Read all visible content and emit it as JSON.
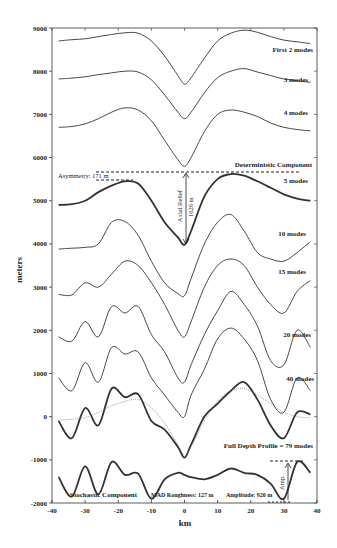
{
  "chart_data": {
    "type": "line",
    "title": "",
    "xlabel": "km",
    "ylabel": "meters",
    "xlim": [
      -40,
      40
    ],
    "ylim": [
      -2000,
      9000
    ],
    "xticks": [
      -40,
      -30,
      -20,
      -10,
      0,
      10,
      20,
      30,
      40
    ],
    "yticks": [
      -2000,
      -1000,
      0,
      1000,
      2000,
      3000,
      4000,
      5000,
      6000,
      7000,
      8000,
      9000
    ],
    "grid": false,
    "x": [
      -38,
      -34,
      -30,
      -26,
      -22,
      -18,
      -14,
      -10,
      -6,
      -2,
      0,
      2,
      6,
      10,
      14,
      18,
      22,
      26,
      30,
      34,
      38
    ],
    "series": [
      {
        "name": "First 2 modes",
        "style": "thin",
        "values": [
          8700,
          8730,
          8750,
          8800,
          8850,
          8890,
          8880,
          8700,
          8350,
          7900,
          7700,
          7850,
          8300,
          8700,
          8880,
          8950,
          8900,
          8800,
          8720,
          8680,
          8640
        ]
      },
      {
        "name": "3 modes",
        "style": "thin",
        "values": [
          7820,
          7840,
          7870,
          7920,
          7960,
          8000,
          7980,
          7800,
          7450,
          7050,
          6900,
          7050,
          7500,
          7850,
          8000,
          8060,
          7980,
          7900,
          7820,
          7780,
          7740
        ]
      },
      {
        "name": "4 modes",
        "style": "thin",
        "values": [
          6700,
          6720,
          6780,
          6900,
          7050,
          7150,
          7100,
          6850,
          6400,
          5950,
          5800,
          6000,
          6600,
          7000,
          7100,
          7050,
          6950,
          6800,
          6700,
          6650,
          6620
        ]
      },
      {
        "name": "5 modes (Deterministic Component)",
        "style": "thick",
        "values": [
          4900,
          4920,
          5000,
          5200,
          5350,
          5450,
          5400,
          5000,
          4500,
          4150,
          3980,
          4300,
          5100,
          5500,
          5620,
          5580,
          5450,
          5300,
          5150,
          5050,
          5000
        ]
      },
      {
        "name": "10 modes",
        "style": "thin",
        "values": [
          3880,
          3900,
          3920,
          4000,
          4500,
          4520,
          4200,
          3600,
          3100,
          2850,
          2800,
          3200,
          4000,
          4500,
          4680,
          4300,
          3800,
          3650,
          3600,
          3800,
          4050
        ]
      },
      {
        "name": "15 modes",
        "style": "thin",
        "values": [
          2830,
          2820,
          3100,
          3000,
          3300,
          3600,
          3500,
          3100,
          2600,
          2000,
          1850,
          2200,
          3000,
          3500,
          3650,
          3500,
          3000,
          2600,
          2400,
          2900,
          3150
        ]
      },
      {
        "name": "20 modes",
        "style": "thin",
        "values": [
          1850,
          1750,
          2200,
          1850,
          2550,
          2400,
          2550,
          1900,
          1500,
          900,
          800,
          1200,
          1900,
          2450,
          2900,
          2600,
          2100,
          1300,
          1200,
          2000,
          1600
        ]
      },
      {
        "name": "40 modes",
        "style": "thin",
        "values": [
          900,
          600,
          1250,
          800,
          1600,
          1450,
          1500,
          900,
          500,
          100,
          0,
          500,
          1100,
          1800,
          2050,
          1800,
          1300,
          400,
          100,
          900,
          600
        ]
      },
      {
        "name": "Full Depth Profile = 79 modes",
        "style": "thick",
        "values": [
          -100,
          -500,
          200,
          -200,
          650,
          450,
          520,
          -100,
          -300,
          -700,
          -950,
          -650,
          0,
          300,
          600,
          800,
          400,
          -200,
          -500,
          100,
          50
        ]
      },
      {
        "name": "Deterministic (reference, dotted)",
        "style": "dotted",
        "values": [
          -80,
          -60,
          -20,
          100,
          250,
          350,
          400,
          200,
          -150,
          -650,
          -900,
          -700,
          -100,
          350,
          600,
          650,
          500,
          300,
          100,
          0,
          -30
        ]
      },
      {
        "name": "Stochastic Component",
        "style": "thick",
        "values": [
          -1400,
          -1850,
          -1150,
          -1800,
          -1050,
          -1350,
          -1320,
          -1900,
          -1450,
          -1300,
          -1350,
          -1400,
          -1450,
          -1350,
          -1200,
          -1300,
          -1350,
          -1550,
          -1900,
          -1050,
          -1300
        ]
      }
    ],
    "annotations": {
      "asymmetry": "Asymmetry: 171 m",
      "axial_relief": "Axial Relief",
      "axial_relief_value": "1626 m",
      "deterministic": "Deterministic Component",
      "stochastic": "Stochastic Component",
      "mad_roughness": "MAD Roughness: 127 m",
      "amplitude": "Amplitude: 920 m",
      "amp": "Amp."
    },
    "labels": {
      "first2": "First 2 modes",
      "m3": "3 modes",
      "m4": "4 modes",
      "m5": "5 modes",
      "m10": "10 modes",
      "m15": "15 modes",
      "m20": "20 modes",
      "m40": "40 modes",
      "full": "Full Depth Profile = 79 modes"
    },
    "tick_labels": {
      "y": [
        "9000",
        "8000",
        "7000",
        "6000",
        "5000",
        "4000",
        "3000",
        "2000",
        "1000",
        "0",
        "-1000",
        "-2000"
      ],
      "x": [
        "-40",
        "-30",
        "-20",
        "-10",
        "0",
        "10",
        "20",
        "30",
        "40"
      ]
    }
  }
}
